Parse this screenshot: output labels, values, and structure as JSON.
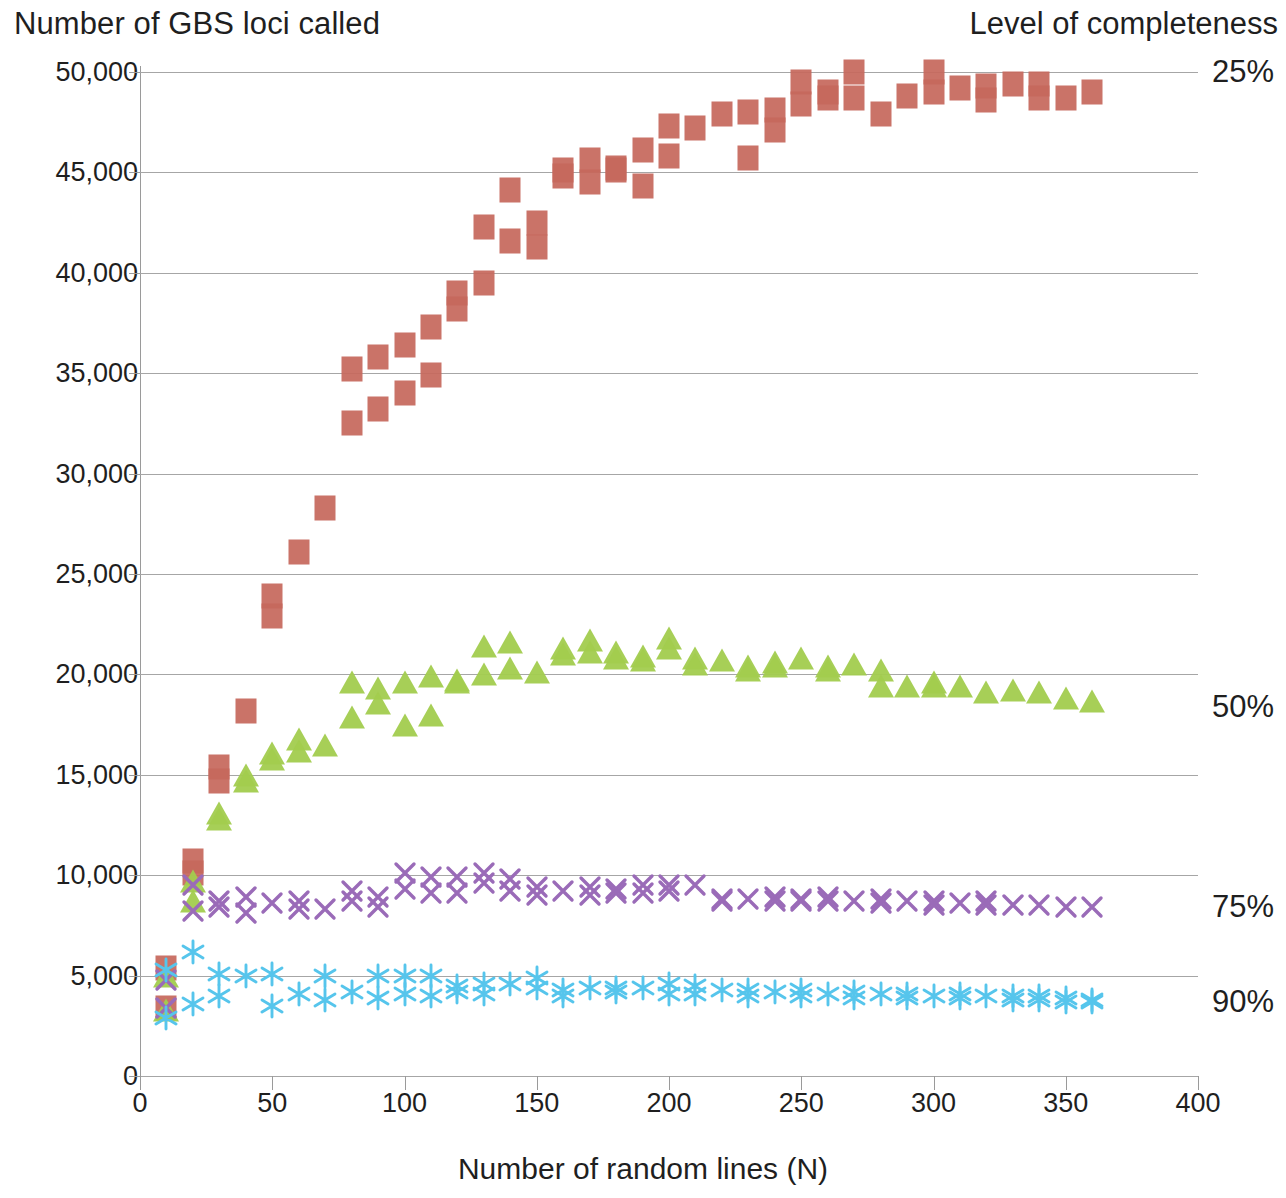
{
  "chart_data": {
    "type": "scatter",
    "title": "Number of GBS loci called",
    "ylabel": "Number of GBS loci called",
    "xlabel": "Number of random lines (N)",
    "legend_title": "Level of completeness",
    "legend_position": "right",
    "grid": true,
    "xlim": [
      0,
      400
    ],
    "ylim": [
      0,
      50000
    ],
    "xticks": [
      0,
      50,
      100,
      150,
      200,
      250,
      300,
      350,
      400
    ],
    "xtick_labels": [
      "0",
      "50",
      "100",
      "150",
      "200",
      "250",
      "300",
      "350",
      "400"
    ],
    "yticks": [
      0,
      5000,
      10000,
      15000,
      20000,
      25000,
      30000,
      35000,
      40000,
      45000,
      50000
    ],
    "ytick_labels": [
      "0",
      "5,000",
      "10,000",
      "15,000",
      "20,000",
      "25,000",
      "30,000",
      "35,000",
      "40,000",
      "45,000",
      "50,000"
    ],
    "series": [
      {
        "name": "25%",
        "label": "25%",
        "color": "#c6685c",
        "marker": "square",
        "label_y": 50000,
        "x": [
          10,
          10,
          20,
          20,
          30,
          30,
          40,
          50,
          50,
          60,
          70,
          80,
          80,
          90,
          90,
          100,
          100,
          110,
          110,
          120,
          120,
          130,
          130,
          140,
          140,
          150,
          150,
          160,
          160,
          170,
          170,
          180,
          180,
          190,
          190,
          200,
          200,
          210,
          220,
          230,
          230,
          240,
          240,
          250,
          250,
          260,
          260,
          270,
          270,
          280,
          290,
          300,
          300,
          310,
          320,
          320,
          330,
          340,
          340,
          350,
          360
        ],
        "y": [
          5400,
          3400,
          10700,
          10100,
          15400,
          14700,
          18200,
          23900,
          22900,
          26100,
          28300,
          35200,
          32500,
          35800,
          33200,
          36400,
          34000,
          37300,
          34900,
          39000,
          38200,
          39500,
          42300,
          44100,
          41600,
          42500,
          41300,
          45100,
          44800,
          45600,
          44500,
          45200,
          45100,
          46100,
          44300,
          47300,
          45800,
          47200,
          47900,
          48000,
          45700,
          48100,
          47100,
          49500,
          48400,
          49000,
          48700,
          50000,
          48700,
          47900,
          48800,
          50000,
          49000,
          49200,
          49300,
          48600,
          49400,
          49400,
          48700,
          48700,
          49000
        ]
      },
      {
        "name": "50%",
        "label": "50%",
        "color": "#a2cc4e",
        "marker": "triangle",
        "label_y": 18400,
        "x": [
          10,
          10,
          20,
          20,
          30,
          30,
          40,
          40,
          50,
          50,
          60,
          60,
          70,
          80,
          80,
          90,
          90,
          100,
          100,
          110,
          110,
          120,
          120,
          130,
          130,
          140,
          140,
          150,
          160,
          160,
          170,
          170,
          180,
          180,
          190,
          190,
          200,
          200,
          210,
          210,
          220,
          230,
          230,
          240,
          240,
          250,
          260,
          260,
          270,
          280,
          280,
          290,
          300,
          300,
          310,
          320,
          330,
          340,
          350,
          360
        ],
        "y": [
          5000,
          3300,
          9700,
          8700,
          13100,
          12800,
          15000,
          14700,
          16100,
          15800,
          16800,
          16200,
          16500,
          19600,
          17900,
          19300,
          18600,
          19600,
          17500,
          19900,
          18000,
          19700,
          19600,
          21400,
          20000,
          21600,
          20300,
          20100,
          21300,
          21000,
          21700,
          21100,
          21100,
          20800,
          20900,
          20700,
          21800,
          21300,
          20800,
          20500,
          20700,
          20400,
          20200,
          20600,
          20400,
          20800,
          20400,
          20200,
          20500,
          20200,
          19400,
          19400,
          19600,
          19400,
          19400,
          19100,
          19200,
          19100,
          18800,
          18700
        ]
      },
      {
        "name": "75%",
        "label": "75%",
        "color": "#9a6bb8",
        "marker": "x",
        "label_y": 8400,
        "x": [
          10,
          10,
          20,
          20,
          30,
          30,
          40,
          40,
          50,
          60,
          60,
          70,
          80,
          80,
          90,
          90,
          100,
          100,
          110,
          110,
          120,
          120,
          130,
          130,
          140,
          140,
          150,
          150,
          160,
          170,
          170,
          180,
          180,
          190,
          190,
          200,
          200,
          210,
          220,
          220,
          230,
          240,
          240,
          250,
          250,
          260,
          260,
          270,
          280,
          280,
          290,
          300,
          300,
          310,
          320,
          320,
          330,
          340,
          350,
          360
        ],
        "y": [
          4700,
          3300,
          9400,
          8100,
          8600,
          8300,
          8800,
          8000,
          8500,
          8600,
          8200,
          8200,
          9100,
          8600,
          8800,
          8300,
          10000,
          9200,
          9800,
          9000,
          9800,
          9000,
          10000,
          9500,
          9700,
          9100,
          9300,
          8900,
          9100,
          9300,
          8900,
          9200,
          9000,
          9400,
          9000,
          9400,
          9100,
          9400,
          8700,
          8600,
          8700,
          8800,
          8600,
          8700,
          8600,
          8800,
          8600,
          8600,
          8700,
          8500,
          8600,
          8600,
          8400,
          8500,
          8600,
          8400,
          8400,
          8400,
          8300,
          8300
        ]
      },
      {
        "name": "90%",
        "label": "90%",
        "color": "#56c5ec",
        "marker": "asterisk",
        "label_y": 3700,
        "x": [
          10,
          10,
          20,
          20,
          30,
          30,
          40,
          50,
          50,
          60,
          70,
          70,
          80,
          90,
          90,
          100,
          100,
          110,
          110,
          120,
          120,
          130,
          130,
          140,
          150,
          150,
          160,
          160,
          170,
          180,
          180,
          190,
          200,
          200,
          210,
          210,
          220,
          230,
          230,
          240,
          250,
          250,
          260,
          270,
          270,
          280,
          290,
          290,
          300,
          310,
          310,
          320,
          330,
          330,
          340,
          340,
          350,
          350,
          360,
          360
        ],
        "y": [
          5200,
          2800,
          6100,
          3500,
          5000,
          3900,
          4900,
          5000,
          3400,
          4000,
          4900,
          3700,
          4100,
          4900,
          3800,
          4900,
          4000,
          4900,
          3900,
          4400,
          4100,
          4500,
          4000,
          4500,
          4800,
          4300,
          4200,
          3900,
          4300,
          4300,
          4100,
          4300,
          4500,
          4000,
          4400,
          4000,
          4200,
          4200,
          3900,
          4100,
          4200,
          3900,
          4000,
          4100,
          3800,
          4000,
          4000,
          3800,
          3900,
          4000,
          3800,
          3900,
          3900,
          3700,
          3900,
          3700,
          3800,
          3600,
          3700,
          3600
        ]
      }
    ]
  }
}
